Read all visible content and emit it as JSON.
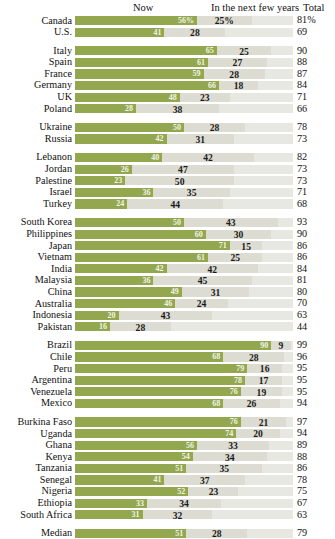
{
  "header": {
    "col_now": "Now",
    "col_next": "In the next few years",
    "col_total": "Total"
  },
  "colors": {
    "now_bar": "#93a84e",
    "next_bar": "#dcdcd2",
    "track": "#e8e8e2",
    "text": "#1a1a1a"
  },
  "chart_data": {
    "type": "bar",
    "title": "",
    "xlabel": "",
    "ylabel": "",
    "xlim": [
      0,
      100
    ],
    "grid": false,
    "legend_position": "top",
    "stacked": true,
    "categories": [
      "Canada",
      "U.S.",
      "Italy",
      "Spain",
      "France",
      "Germany",
      "UK",
      "Poland",
      "Ukraine",
      "Russia",
      "Lebanon",
      "Jordan",
      "Palestine",
      "Israel",
      "Turkey",
      "South Korea",
      "Philippines",
      "Japan",
      "Vietnam",
      "India",
      "Malaysia",
      "China",
      "Australia",
      "Indonesia",
      "Pakistan",
      "Brazil",
      "Chile",
      "Peru",
      "Argentina",
      "Venezuela",
      "Mexico",
      "Burkina Faso",
      "Uganda",
      "Ghana",
      "Kenya",
      "Tanzania",
      "Senegal",
      "Nigeria",
      "Ethiopia",
      "South Africa",
      "Median"
    ],
    "series": [
      {
        "name": "Now",
        "values": [
          56,
          41,
          65,
          61,
          59,
          66,
          48,
          28,
          50,
          42,
          40,
          26,
          23,
          36,
          24,
          50,
          60,
          71,
          61,
          42,
          36,
          49,
          46,
          20,
          16,
          90,
          68,
          79,
          78,
          76,
          68,
          76,
          74,
          56,
          54,
          51,
          41,
          52,
          33,
          31,
          51
        ]
      },
      {
        "name": "In the next few years",
        "values": [
          25,
          28,
          25,
          27,
          28,
          18,
          23,
          38,
          28,
          31,
          42,
          47,
          50,
          35,
          44,
          43,
          30,
          15,
          25,
          42,
          45,
          31,
          24,
          43,
          28,
          9,
          28,
          16,
          17,
          19,
          26,
          21,
          20,
          33,
          34,
          35,
          37,
          23,
          34,
          32,
          28
        ]
      }
    ],
    "totals": [
      81,
      69,
      90,
      88,
      87,
      84,
      71,
      66,
      78,
      73,
      82,
      73,
      73,
      71,
      68,
      93,
      90,
      86,
      86,
      84,
      81,
      80,
      70,
      63,
      44,
      99,
      96,
      95,
      95,
      95,
      94,
      97,
      94,
      89,
      88,
      86,
      78,
      75,
      67,
      63,
      79
    ]
  },
  "groups": [
    {
      "name": "north-america",
      "rows": [
        {
          "label": "Canada",
          "now": 56,
          "now_text": "56%",
          "next": 25,
          "next_text": "25%",
          "total": "81%"
        },
        {
          "label": "U.S.",
          "now": 41,
          "now_text": "41",
          "next": 28,
          "next_text": "28",
          "total": "69"
        }
      ]
    },
    {
      "name": "europe",
      "rows": [
        {
          "label": "Italy",
          "now": 65,
          "now_text": "65",
          "next": 25,
          "next_text": "25",
          "total": "90"
        },
        {
          "label": "Spain",
          "now": 61,
          "now_text": "61",
          "next": 27,
          "next_text": "27",
          "total": "88"
        },
        {
          "label": "France",
          "now": 59,
          "now_text": "59",
          "next": 28,
          "next_text": "28",
          "total": "87"
        },
        {
          "label": "Germany",
          "now": 66,
          "now_text": "66",
          "next": 18,
          "next_text": "18",
          "total": "84"
        },
        {
          "label": "UK",
          "now": 48,
          "now_text": "48",
          "next": 23,
          "next_text": "23",
          "total": "71"
        },
        {
          "label": "Poland",
          "now": 28,
          "now_text": "28",
          "next": 38,
          "next_text": "38",
          "total": "66"
        }
      ]
    },
    {
      "name": "eastern-europe",
      "rows": [
        {
          "label": "Ukraine",
          "now": 50,
          "now_text": "50",
          "next": 28,
          "next_text": "28",
          "total": "78"
        },
        {
          "label": "Russia",
          "now": 42,
          "now_text": "42",
          "next": 31,
          "next_text": "31",
          "total": "73"
        }
      ]
    },
    {
      "name": "middle-east",
      "rows": [
        {
          "label": "Lebanon",
          "now": 40,
          "now_text": "40",
          "next": 42,
          "next_text": "42",
          "total": "82"
        },
        {
          "label": "Jordan",
          "now": 26,
          "now_text": "26",
          "next": 47,
          "next_text": "47",
          "total": "73"
        },
        {
          "label": "Palestine",
          "now": 23,
          "now_text": "23",
          "next": 50,
          "next_text": "50",
          "total": "73"
        },
        {
          "label": "Israel",
          "now": 36,
          "now_text": "36",
          "next": 35,
          "next_text": "35",
          "total": "71"
        },
        {
          "label": "Turkey",
          "now": 24,
          "now_text": "24",
          "next": 44,
          "next_text": "44",
          "total": "68"
        }
      ]
    },
    {
      "name": "asia-pacific",
      "rows": [
        {
          "label": "South Korea",
          "now": 50,
          "now_text": "50",
          "next": 43,
          "next_text": "43",
          "total": "93"
        },
        {
          "label": "Philippines",
          "now": 60,
          "now_text": "60",
          "next": 30,
          "next_text": "30",
          "total": "90"
        },
        {
          "label": "Japan",
          "now": 71,
          "now_text": "71",
          "next": 15,
          "next_text": "15",
          "total": "86"
        },
        {
          "label": "Vietnam",
          "now": 61,
          "now_text": "61",
          "next": 25,
          "next_text": "25",
          "total": "86"
        },
        {
          "label": "India",
          "now": 42,
          "now_text": "42",
          "next": 42,
          "next_text": "42",
          "total": "84"
        },
        {
          "label": "Malaysia",
          "now": 36,
          "now_text": "36",
          "next": 45,
          "next_text": "45",
          "total": "81"
        },
        {
          "label": "China",
          "now": 49,
          "now_text": "49",
          "next": 31,
          "next_text": "31",
          "total": "80"
        },
        {
          "label": "Australia",
          "now": 46,
          "now_text": "46",
          "next": 24,
          "next_text": "24",
          "total": "70"
        },
        {
          "label": "Indonesia",
          "now": 20,
          "now_text": "20",
          "next": 43,
          "next_text": "43",
          "total": "63"
        },
        {
          "label": "Pakistan",
          "now": 16,
          "now_text": "16",
          "next": 28,
          "next_text": "28",
          "total": "44"
        }
      ]
    },
    {
      "name": "latin-america",
      "rows": [
        {
          "label": "Brazil",
          "now": 90,
          "now_text": "90",
          "next": 9,
          "next_text": "9",
          "total": "99"
        },
        {
          "label": "Chile",
          "now": 68,
          "now_text": "68",
          "next": 28,
          "next_text": "28",
          "total": "96"
        },
        {
          "label": "Peru",
          "now": 79,
          "now_text": "79",
          "next": 16,
          "next_text": "16",
          "total": "95"
        },
        {
          "label": "Argentina",
          "now": 78,
          "now_text": "78",
          "next": 17,
          "next_text": "17",
          "total": "95"
        },
        {
          "label": "Venezuela",
          "now": 76,
          "now_text": "76",
          "next": 19,
          "next_text": "19",
          "total": "95"
        },
        {
          "label": "Mexico",
          "now": 68,
          "now_text": "68",
          "next": 26,
          "next_text": "26",
          "total": "94"
        }
      ]
    },
    {
      "name": "africa",
      "rows": [
        {
          "label": "Burkina Faso",
          "now": 76,
          "now_text": "76",
          "next": 21,
          "next_text": "21",
          "total": "97"
        },
        {
          "label": "Uganda",
          "now": 74,
          "now_text": "74",
          "next": 20,
          "next_text": "20",
          "total": "94"
        },
        {
          "label": "Ghana",
          "now": 56,
          "now_text": "56",
          "next": 33,
          "next_text": "33",
          "total": "89"
        },
        {
          "label": "Kenya",
          "now": 54,
          "now_text": "54",
          "next": 34,
          "next_text": "34",
          "total": "88"
        },
        {
          "label": "Tanzania",
          "now": 51,
          "now_text": "51",
          "next": 35,
          "next_text": "35",
          "total": "86"
        },
        {
          "label": "Senegal",
          "now": 41,
          "now_text": "41",
          "next": 37,
          "next_text": "37",
          "total": "78"
        },
        {
          "label": "Nigeria",
          "now": 52,
          "now_text": "52",
          "next": 23,
          "next_text": "23",
          "total": "75"
        },
        {
          "label": "Ethiopia",
          "now": 33,
          "now_text": "33",
          "next": 34,
          "next_text": "34",
          "total": "67"
        },
        {
          "label": "South Africa",
          "now": 31,
          "now_text": "31",
          "next": 32,
          "next_text": "32",
          "total": "63"
        }
      ]
    },
    {
      "name": "median",
      "rows": [
        {
          "label": "Median",
          "now": 51,
          "now_text": "51",
          "next": 28,
          "next_text": "28",
          "total": "79"
        }
      ]
    }
  ]
}
